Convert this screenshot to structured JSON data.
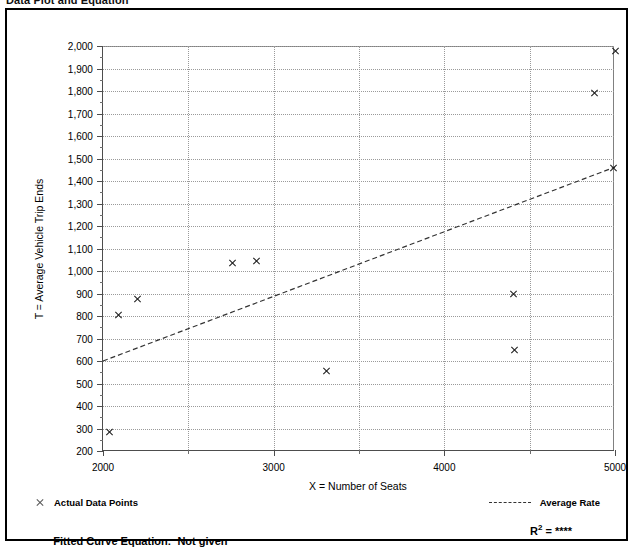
{
  "document": {
    "heading": "Data Plot and Equation"
  },
  "legend": {
    "points_marker": "x-marker-icon",
    "points_label": "Actual Data Points",
    "rate_marker": "dashed-line-icon",
    "rate_label": "Average Rate"
  },
  "footer": {
    "fitted_label": "Fitted Curve Equation:",
    "fitted_value": "Not given",
    "r_symbol": "R",
    "r_exponent": "2",
    "r_equals": " = ",
    "r_value": "****"
  },
  "colors": {
    "ink": "#000000",
    "axis": "#4d4d4d",
    "grid": "#9a9a9a",
    "marker": "#1a1a1a",
    "trend": "#333333"
  },
  "chart_data": {
    "type": "scatter",
    "title": "Data Plot and Equation",
    "xlabel": "X = Number of Seats",
    "ylabel": "T = Average Vehicle Trip Ends",
    "xlim": [
      2000,
      5000
    ],
    "ylim": [
      200,
      2000
    ],
    "xticks": [
      2000,
      2500,
      3000,
      3500,
      4000,
      4500,
      5000
    ],
    "xtick_labels": [
      "2000",
      "",
      "3000",
      "",
      "4000",
      "",
      "5000"
    ],
    "yticks": [
      200,
      300,
      400,
      500,
      600,
      700,
      800,
      900,
      1000,
      1100,
      1200,
      1300,
      1400,
      1500,
      1600,
      1700,
      1800,
      1900,
      2000
    ],
    "ytick_labels": [
      "200",
      "300",
      "400",
      "500",
      "600",
      "700",
      "800",
      "900",
      "1,000",
      "1,100",
      "1,200",
      "1,300",
      "1,400",
      "1,500",
      "1,600",
      "1,700",
      "1,800",
      "1,900",
      "2,000"
    ],
    "grid": true,
    "legend_position": "below-axes",
    "series": [
      {
        "name": "Actual Data Points",
        "type": "scatter",
        "marker": "x",
        "points": [
          {
            "x": 2040,
            "y": 285
          },
          {
            "x": 2090,
            "y": 805
          },
          {
            "x": 2205,
            "y": 875
          },
          {
            "x": 2760,
            "y": 1035
          },
          {
            "x": 2900,
            "y": 1045
          },
          {
            "x": 3310,
            "y": 555
          },
          {
            "x": 4405,
            "y": 900
          },
          {
            "x": 4410,
            "y": 650
          },
          {
            "x": 4880,
            "y": 1790
          },
          {
            "x": 4990,
            "y": 1460
          },
          {
            "x": 5000,
            "y": 1980
          }
        ]
      },
      {
        "name": "Average Rate",
        "type": "line",
        "style": "dashed",
        "points": [
          {
            "x": 2000,
            "y": 600
          },
          {
            "x": 5000,
            "y": 1462
          }
        ]
      }
    ]
  }
}
